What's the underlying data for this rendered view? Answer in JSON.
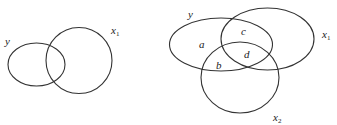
{
  "diagrams": [
    {
      "id": "left",
      "description": "Two overlapping sets: y and x1",
      "sets": [
        {
          "name": "y",
          "label": "y",
          "shape": "ellipse",
          "cx": 36.5,
          "cy": 64.5,
          "rx": 28.5,
          "ry": 21.5,
          "label_pos": [
            5,
            45
          ]
        },
        {
          "name": "x1",
          "label": "x",
          "sub": "1",
          "shape": "circle",
          "cx": 79,
          "cy": 60.5,
          "rx": 33,
          "ry": 33,
          "label_pos": [
            111,
            34
          ]
        }
      ]
    },
    {
      "id": "right",
      "description": "Three overlapping sets: y, x1, x2 with labeled regions a, b, c, d",
      "sets": [
        {
          "name": "y",
          "label": "y",
          "shape": "ellipse",
          "cx": 221,
          "cy": 44.5,
          "rx": 51.5,
          "ry": 26.5,
          "label_pos": [
            188,
            18
          ]
        },
        {
          "name": "x1",
          "label": "x",
          "sub": "1",
          "shape": "ellipse",
          "cx": 267.5,
          "cy": 39,
          "rx": 46.5,
          "ry": 31,
          "label_pos": [
            322,
            38
          ]
        },
        {
          "name": "x2",
          "label": "x",
          "sub": "2",
          "shape": "circle",
          "cx": 240,
          "cy": 77.5,
          "rx": 39,
          "ry": 35.5,
          "label_pos": [
            273,
            121
          ]
        }
      ],
      "regions": [
        {
          "label": "a",
          "pos": [
            199,
            48
          ]
        },
        {
          "label": "c",
          "pos": [
            241,
            35
          ]
        },
        {
          "label": "d",
          "pos": [
            244,
            58
          ]
        },
        {
          "label": "b",
          "pos": [
            216,
            69
          ]
        }
      ]
    }
  ],
  "colors": {
    "stroke": "#333333",
    "text": "#222222",
    "background": "#ffffff"
  }
}
